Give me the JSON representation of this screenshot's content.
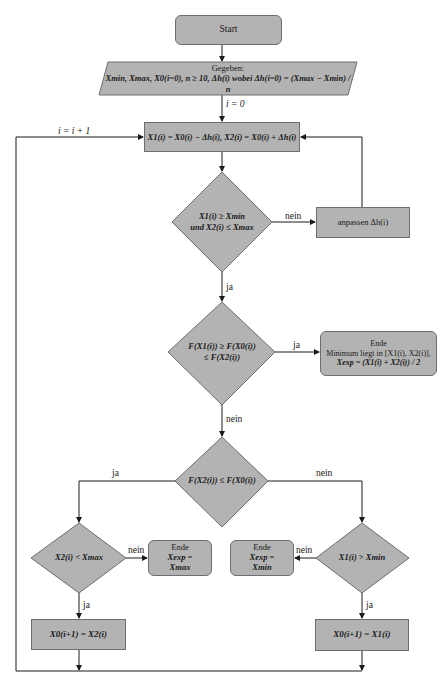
{
  "flowchart": {
    "start": {
      "label": "Start"
    },
    "given": {
      "title": "Gegeben:",
      "line": "Xmin, Xmax, X0(i=0), n ≥ 10, Δh(i) wobei Δh(i=0) = (Xmax − Xmin) / n"
    },
    "init_label": "i = 0",
    "loop_label": "i = i + 1",
    "compute": {
      "label": "X1(i) = X0(i) − Δh(i), X2(i) = X0(i) + Δh(i)"
    },
    "decision_bounds": {
      "line1": "X1(i) ≥ Xmin",
      "line2": "und X2(i) ≤ Xmax"
    },
    "adjust": {
      "label": "anpassen Δh(i)"
    },
    "decision_min": {
      "line1": "F(X1(i)) ≥ F(X0(i))",
      "line2": "≤ F(X2(i))"
    },
    "end_min": {
      "title": "Ende",
      "line1": "Minimum liegt in [X1(i), X2(i)],",
      "line2": "Xexp = (X1(i) + X2(i)) / 2"
    },
    "decision_compare": {
      "label": "F(X2(i)) ≤ F(X0(i))"
    },
    "decision_left": {
      "label": "X2(i) < Xmax"
    },
    "end_left": {
      "title": "Ende",
      "line1": "Xexp =",
      "line2": "Xmax"
    },
    "decision_right": {
      "label": "X1(i) > Xmin"
    },
    "end_right": {
      "title": "Ende",
      "line1": "Xexp =",
      "line2": "Xmin"
    },
    "update_left": {
      "label": "X0(i+1) = X2(i)"
    },
    "update_right": {
      "label": "X0(i+1) = X1(i)"
    },
    "edge_labels": {
      "bounds_no": "nein",
      "bounds_yes": "ja",
      "min_yes": "ja",
      "min_no": "nein",
      "compare_yes": "ja",
      "compare_no": "nein",
      "left_no": "nein",
      "left_yes": "ja",
      "right_no": "nein",
      "right_yes": "ja"
    },
    "colors": {
      "fill": "#b3b3b3",
      "stroke": "#6e6e6e",
      "line": "#1a1a1a",
      "background": "#ffffff"
    }
  }
}
